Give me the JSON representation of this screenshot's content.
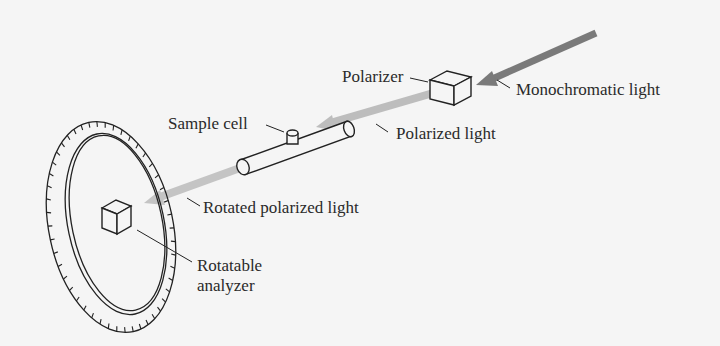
{
  "diagram": {
    "labels": {
      "polarizer": "Polarizer",
      "monochromatic_light": "Monochromatic light",
      "sample_cell": "Sample cell",
      "polarized_light": "Polarized light",
      "rotated_polarized_light": "Rotated polarized light",
      "rotatable_analyzer_line1": "Rotatable",
      "rotatable_analyzer_line2": "analyzer"
    },
    "colors": {
      "background": "#f5f5f5",
      "monochromatic_beam": "#7a7a7a",
      "polarized_beam": "#b8b8b8",
      "rotated_beam": "#c4c4c4",
      "line": "#222222",
      "text": "#2a2a2a"
    }
  }
}
